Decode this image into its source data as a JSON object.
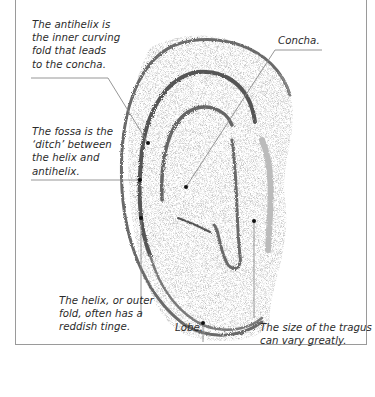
{
  "diagram": {
    "labels": {
      "antihelix": "The antihelix is\nthe inner curving\nfold that leads\nto the concha.",
      "fossa": "The fossa is the\n‘ditch’ between\nthe helix and\nantihelix.",
      "concha": "Concha.",
      "helix": "The helix, or outer\nfold, often has a\nreddish tinge.",
      "lobe": "Lobe.",
      "tragus": "The size of the tragus\ncan vary greatly."
    },
    "colors": {
      "frame": "#9a9a9a",
      "leader": "#8a8a8a",
      "text": "#2b2b2b",
      "pencil_dark": "#5a5a5a",
      "pencil_light": "#b5b5b5"
    }
  }
}
